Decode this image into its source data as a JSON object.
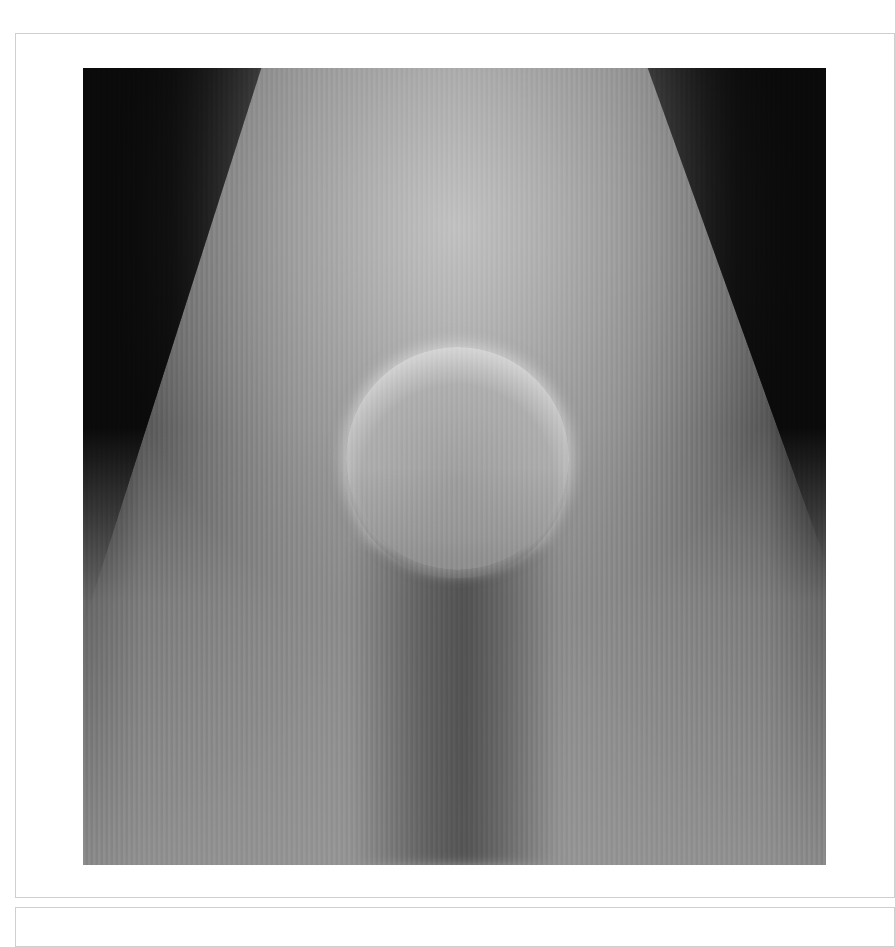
{
  "panel": {
    "image": {
      "description": "Grayscale photograph of a glowing sphere suspended in a cone of hazy light against a dark background",
      "colors": {
        "background": "#0d0d0d",
        "haze": "#bdbdbd",
        "sphere_rim": "#f5f5f5",
        "frame_border": "#cfcfcf"
      }
    }
  }
}
